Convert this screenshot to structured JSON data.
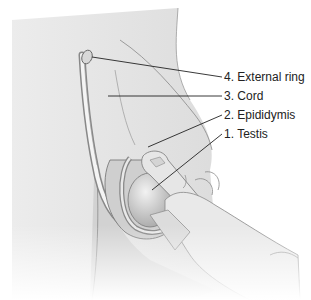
{
  "figure": {
    "labels": [
      {
        "id": "external-ring",
        "text": "4. External ring",
        "x": 224,
        "y": 70
      },
      {
        "id": "cord",
        "text": "3. Cord",
        "x": 224,
        "y": 89
      },
      {
        "id": "epididymis",
        "text": "2. Epididymis",
        "x": 224,
        "y": 108
      },
      {
        "id": "testis",
        "text": "1. Testis",
        "x": 224,
        "y": 127
      }
    ],
    "colors": {
      "skin_light": "#e2e2e2",
      "skin_mid": "#c9c9c9",
      "outline": "#7a7a7a",
      "leader": "#222222",
      "text": "#222222"
    }
  }
}
